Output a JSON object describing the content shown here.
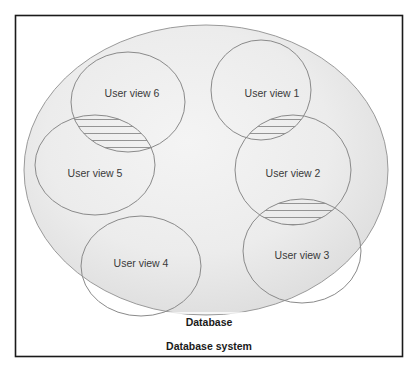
{
  "diagram": {
    "system_label": "Database system",
    "database_label": "Database",
    "colors": {
      "frame": "#1a1a1a",
      "database_fill_light": "#f3f3f3",
      "database_fill_dark": "#d9d9d9",
      "ellipse_stroke": "#8a8a8a",
      "hatch": "#8a8a8a",
      "text": "#3a3a3a"
    },
    "user_views": [
      {
        "id": 1,
        "label": "User view 1"
      },
      {
        "id": 2,
        "label": "User view 2"
      },
      {
        "id": 3,
        "label": "User view 3"
      },
      {
        "id": 4,
        "label": "User view 4"
      },
      {
        "id": 5,
        "label": "User view 5"
      },
      {
        "id": 6,
        "label": "User view 6"
      }
    ],
    "overlaps": [
      {
        "between": [
          "User view 6",
          "User view 5"
        ],
        "hatched": true
      },
      {
        "between": [
          "User view 1",
          "User view 2"
        ],
        "hatched": true
      },
      {
        "between": [
          "User view 2",
          "User view 3"
        ],
        "hatched": true
      }
    ]
  }
}
